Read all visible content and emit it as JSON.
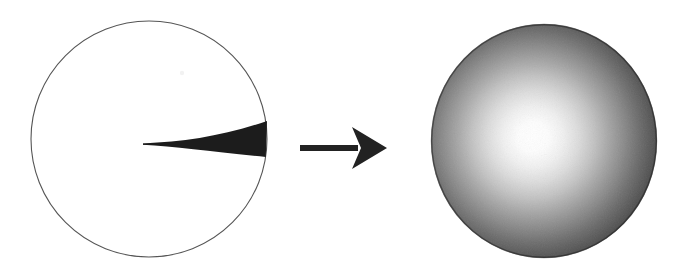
{
  "figure": {
    "caption": "Left: outline circle containing a narrow dark wedge from center to rim. Right: arrow. Far right: sphere with diffuse radial shading.",
    "background_color": "#ffffff",
    "ink_color": "#1a1a1a",
    "outline_color": "#4d4d4d",
    "width": 690,
    "height": 277
  },
  "left_panel": {
    "label": "circle-with-wedge",
    "circle": {
      "label": "outline-circle",
      "center_x": 149,
      "center_y": 139,
      "radius": 118,
      "stroke_color": "#555555",
      "stroke_width": 1.1,
      "fill": "none"
    },
    "wedge": {
      "label": "dark-wedge",
      "fill_color": "#1c1c1c",
      "tip_x": 143,
      "tip_y": 144,
      "base_x": 267,
      "base_top_y": 121,
      "base_bottom_y": 157
    },
    "speck": {
      "label": "scan-speck",
      "x": 182,
      "y": 73,
      "radius": 2.2,
      "color": "#f2f2f2"
    }
  },
  "arrow": {
    "label": "transformation-arrow",
    "color": "#222222",
    "shaft_start_x": 300,
    "shaft_end_x": 358,
    "shaft_y": 148,
    "shaft_thickness": 6,
    "tip_x": 387,
    "head_top_y": 127,
    "head_bottom_y": 169,
    "head_back_x": 352,
    "notch_x": 361
  },
  "right_panel": {
    "label": "shaded-sphere",
    "sphere": {
      "label": "gradient-sphere",
      "center_x": 544,
      "center_y": 141,
      "radius_x": 113,
      "radius_y": 117,
      "highlight_x": 533,
      "highlight_y": 137,
      "core_color": "#ffffff",
      "mid_color": "#a8a8a8",
      "edge_color": "#2b2b2b",
      "rim_color": "#1f1f1f"
    }
  }
}
